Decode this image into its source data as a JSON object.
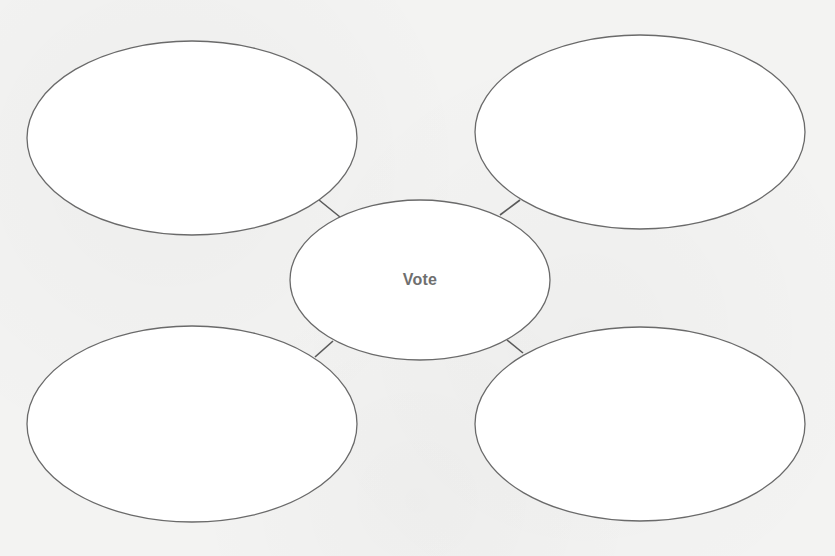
{
  "diagram": {
    "type": "bubble-map",
    "center": {
      "label": "Vote",
      "cx": 420,
      "cy": 280,
      "rx": 130,
      "ry": 80
    },
    "bubbles": [
      {
        "id": "top-left",
        "label": "",
        "cx": 192,
        "cy": 138,
        "rx": 165,
        "ry": 97
      },
      {
        "id": "top-right",
        "label": "",
        "cx": 640,
        "cy": 132,
        "rx": 165,
        "ry": 97
      },
      {
        "id": "bottom-left",
        "label": "",
        "cx": 192,
        "cy": 424,
        "rx": 165,
        "ry": 98
      },
      {
        "id": "bottom-right",
        "label": "",
        "cx": 640,
        "cy": 424,
        "rx": 165,
        "ry": 97
      }
    ],
    "connectors": [
      {
        "from": "top-left",
        "x1": 319,
        "y1": 200,
        "x2": 340,
        "y2": 217
      },
      {
        "from": "top-right",
        "x1": 520,
        "y1": 200,
        "x2": 500,
        "y2": 215
      },
      {
        "from": "bottom-left",
        "x1": 315,
        "y1": 357,
        "x2": 333,
        "y2": 341
      },
      {
        "from": "bottom-right",
        "x1": 523,
        "y1": 353,
        "x2": 507,
        "y2": 340
      }
    ],
    "colors": {
      "stroke": "#6a6a6a",
      "fill": "#ffffff",
      "label": "#6f6f6f",
      "background": "#f3f3f2"
    }
  }
}
